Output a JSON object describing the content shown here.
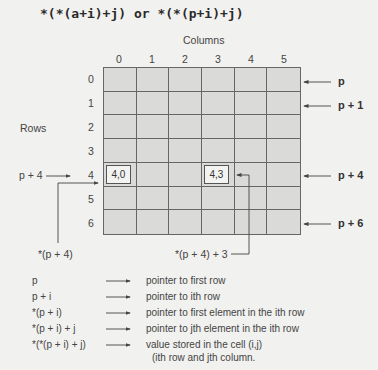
{
  "title": "*(*(a+i)+j) or *(*(p+i)+j)",
  "columns_label": "Columns",
  "rows_label": "Rows",
  "column_indices": [
    "0",
    "1",
    "2",
    "3",
    "4",
    "5"
  ],
  "row_indices": [
    "0",
    "1",
    "2",
    "3",
    "4",
    "5",
    "6"
  ],
  "highlighted_cells": [
    {
      "row": 4,
      "col": 0,
      "label": "4,0"
    },
    {
      "row": 4,
      "col": 3,
      "label": "4,3"
    }
  ],
  "left_pointer": {
    "label": "p + 4",
    "row": 4
  },
  "right_pointers": [
    {
      "label": "p",
      "row": 0
    },
    {
      "label": "p + 1",
      "row": 1
    },
    {
      "label": "p + 4",
      "row": 4
    },
    {
      "label": "p + 6",
      "row": 6
    }
  ],
  "bottom_pointers": [
    {
      "label": "*(p + 4)"
    },
    {
      "label": "*(p + 4) + 3"
    }
  ],
  "legend": [
    {
      "expr": "p",
      "desc": "pointer to first row"
    },
    {
      "expr": "p + i",
      "desc": "pointer to ith row"
    },
    {
      "expr": "*(p + i)",
      "desc": "pointer to first element in the ith row"
    },
    {
      "expr": "*(p + i) + j",
      "desc": "pointer to jth element in the ith row"
    },
    {
      "expr": "*(*(p + i) + j)",
      "desc": "value stored in the cell (i,j)",
      "desc2": "(ith row and jth column."
    }
  ],
  "colors": {
    "grid_fill": "#dadad8",
    "grid_line": "#666666",
    "background": "#f1f1ef"
  }
}
